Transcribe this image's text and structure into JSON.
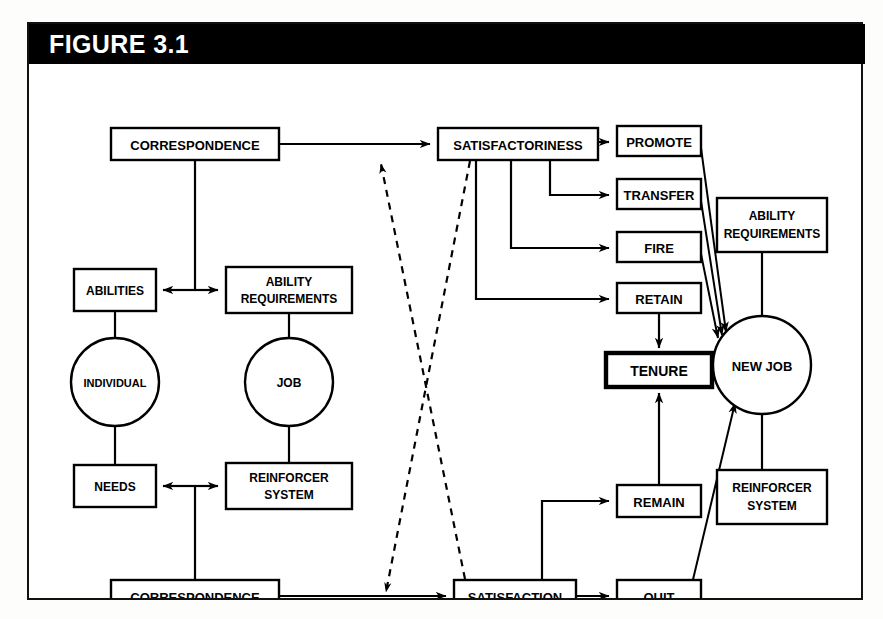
{
  "figure": {
    "title": "FIGURE 3.1",
    "header_bg": "#000000",
    "header_text_color": "#ffffff",
    "frame_border_color": "#111111",
    "canvas_bg": "#ffffff"
  },
  "diagram": {
    "type": "flowchart",
    "nodes": [
      {
        "id": "corr_top",
        "label": "CORRESPONDENCE",
        "shape": "rect",
        "x": 82,
        "y": 64,
        "w": 168,
        "h": 32,
        "font": 13
      },
      {
        "id": "satisfness",
        "label": "SATISFACTORINESS",
        "shape": "rect",
        "x": 409,
        "y": 64,
        "w": 160,
        "h": 32,
        "font": 13
      },
      {
        "id": "promote",
        "label": "PROMOTE",
        "shape": "rect",
        "x": 588,
        "y": 62,
        "w": 84,
        "h": 30,
        "font": 13
      },
      {
        "id": "transfer",
        "label": "TRANSFER",
        "shape": "rect",
        "x": 588,
        "y": 115,
        "w": 84,
        "h": 30,
        "font": 13
      },
      {
        "id": "fire",
        "label": "FIRE",
        "shape": "rect",
        "x": 588,
        "y": 168,
        "w": 84,
        "h": 30,
        "font": 13
      },
      {
        "id": "retain",
        "label": "RETAIN",
        "shape": "rect",
        "x": 588,
        "y": 219,
        "w": 84,
        "h": 30,
        "font": 13
      },
      {
        "id": "tenure",
        "label": "TENURE",
        "shape": "rect",
        "x": 577,
        "y": 289,
        "w": 106,
        "h": 34,
        "font": 14,
        "thick": true
      },
      {
        "id": "remain",
        "label": "REMAIN",
        "shape": "rect",
        "x": 588,
        "y": 421,
        "w": 84,
        "h": 32,
        "font": 13
      },
      {
        "id": "quit",
        "label": "QUIT",
        "shape": "rect",
        "x": 588,
        "y": 516,
        "w": 84,
        "h": 32,
        "font": 13
      },
      {
        "id": "abilities",
        "label": "ABILITIES",
        "shape": "rect",
        "x": 45,
        "y": 205,
        "w": 82,
        "h": 42,
        "font": 12
      },
      {
        "id": "abilreq_l",
        "label": "ABILITY|REQUIREMENTS",
        "shape": "rect",
        "x": 197,
        "y": 203,
        "w": 126,
        "h": 46,
        "font": 12
      },
      {
        "id": "individual",
        "label": "INDIVIDUAL",
        "shape": "circle",
        "x": 86,
        "y": 318,
        "r": 44,
        "font": 11
      },
      {
        "id": "job",
        "label": "JOB",
        "shape": "circle",
        "x": 260,
        "y": 318,
        "r": 44,
        "font": 12
      },
      {
        "id": "needs",
        "label": "NEEDS",
        "shape": "rect",
        "x": 45,
        "y": 401,
        "w": 82,
        "h": 42,
        "font": 12
      },
      {
        "id": "reinf_l",
        "label": "REINFORCER|SYSTEM",
        "shape": "rect",
        "x": 197,
        "y": 399,
        "w": 126,
        "h": 46,
        "font": 12
      },
      {
        "id": "corr_bot",
        "label": "CORRESPONDENCE",
        "shape": "rect",
        "x": 82,
        "y": 516,
        "w": 168,
        "h": 32,
        "font": 13
      },
      {
        "id": "satisfaction",
        "label": "SATISFACTION",
        "shape": "rect",
        "x": 425,
        "y": 516,
        "w": 122,
        "h": 32,
        "font": 13
      },
      {
        "id": "newjob",
        "label": "NEW JOB",
        "shape": "circle",
        "x": 733,
        "y": 301,
        "r": 49,
        "font": 13
      },
      {
        "id": "abilreq_r",
        "label": "ABILITY|REQUIREMENTS",
        "shape": "rect",
        "x": 688,
        "y": 134,
        "w": 110,
        "h": 54,
        "font": 12
      },
      {
        "id": "reinf_r",
        "label": "REINFORCER|SYSTEM",
        "shape": "rect",
        "x": 688,
        "y": 406,
        "w": 110,
        "h": 54,
        "font": 12
      }
    ],
    "edges": [
      {
        "from": "corr_top",
        "to": "satisfness",
        "style": "solid",
        "arrow": "end"
      },
      {
        "from": "satisfness",
        "to": "promote",
        "style": "solid",
        "arrow": "end"
      },
      {
        "from": "satisfness",
        "to": "transfer",
        "style": "solid",
        "arrow": "end"
      },
      {
        "from": "satisfness",
        "to": "fire",
        "style": "solid",
        "arrow": "end"
      },
      {
        "from": "satisfness",
        "to": "retain",
        "style": "solid",
        "arrow": "end"
      },
      {
        "from": "retain",
        "to": "tenure",
        "style": "solid",
        "arrow": "end"
      },
      {
        "from": "remain",
        "to": "tenure",
        "style": "solid",
        "arrow": "end"
      },
      {
        "from": "promote",
        "to": "newjob",
        "style": "solid",
        "arrow": "end"
      },
      {
        "from": "transfer",
        "to": "newjob",
        "style": "solid",
        "arrow": "end"
      },
      {
        "from": "fire",
        "to": "newjob",
        "style": "solid",
        "arrow": "end"
      },
      {
        "from": "quit",
        "to": "newjob",
        "style": "solid",
        "arrow": "end"
      },
      {
        "from": "corr_bot",
        "to": "satisfaction",
        "style": "solid",
        "arrow": "end"
      },
      {
        "from": "satisfaction",
        "to": "quit",
        "style": "solid",
        "arrow": "end"
      },
      {
        "from": "satisfaction",
        "to": "remain",
        "style": "solid",
        "arrow": "end"
      },
      {
        "from": "corr_top",
        "to": "abilities",
        "style": "solid",
        "arrow": "end"
      },
      {
        "from": "corr_top",
        "to": "abilreq_l",
        "style": "solid",
        "arrow": "end"
      },
      {
        "from": "corr_bot",
        "to": "needs",
        "style": "solid",
        "arrow": "end"
      },
      {
        "from": "corr_bot",
        "to": "reinf_l",
        "style": "solid",
        "arrow": "end"
      },
      {
        "from": "abilities",
        "to": "individual",
        "style": "solid",
        "arrow": "none"
      },
      {
        "from": "individual",
        "to": "needs",
        "style": "solid",
        "arrow": "none"
      },
      {
        "from": "abilreq_l",
        "to": "job",
        "style": "solid",
        "arrow": "none"
      },
      {
        "from": "job",
        "to": "reinf_l",
        "style": "solid",
        "arrow": "none"
      },
      {
        "from": "abilreq_r",
        "to": "newjob",
        "style": "solid",
        "arrow": "none"
      },
      {
        "from": "newjob",
        "to": "reinf_r",
        "style": "solid",
        "arrow": "none"
      },
      {
        "from": "satisfness",
        "to": "corr_bot_line",
        "style": "dashed",
        "arrow": "end"
      },
      {
        "from": "satisfaction",
        "to": "corr_top_line",
        "style": "dashed",
        "arrow": "end"
      }
    ]
  }
}
